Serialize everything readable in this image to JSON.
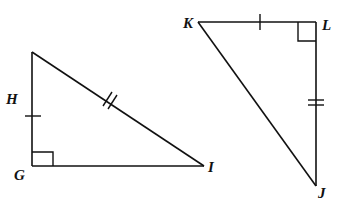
{
  "diagram": {
    "triangles": [
      {
        "name": "triangle-HGI",
        "vertices": {
          "H": {
            "label": "H",
            "x": 32,
            "y": 52
          },
          "G": {
            "label": "G",
            "x": 32,
            "y": 166
          },
          "I": {
            "label": "I",
            "x": 204,
            "y": 166
          }
        },
        "right_angle_at": "G",
        "tick_marks": {
          "HG": 1,
          "HI": 2
        }
      },
      {
        "name": "triangle-KLJ",
        "vertices": {
          "K": {
            "label": "K",
            "x": 198,
            "y": 22
          },
          "L": {
            "label": "L",
            "x": 316,
            "y": 22
          },
          "J": {
            "label": "J",
            "x": 316,
            "y": 186
          }
        },
        "right_angle_at": "L",
        "tick_marks": {
          "KL": 1,
          "LJ": 2
        }
      }
    ],
    "labels": {
      "H": "H",
      "G": "G",
      "I": "I",
      "K": "K",
      "L": "L",
      "J": "J"
    },
    "colors": {
      "stroke": "#111111",
      "background": "#ffffff"
    }
  }
}
